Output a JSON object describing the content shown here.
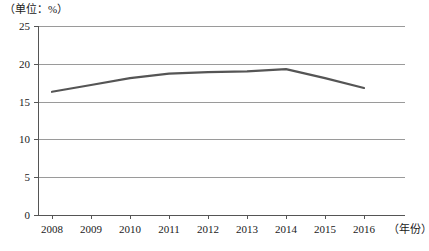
{
  "chart_data": {
    "type": "line",
    "title": "",
    "subtitle": "",
    "unit_label": "（单位：%）",
    "xlabel": "（年份）",
    "ylabel": "",
    "categories": [
      "2008",
      "2009",
      "2010",
      "2011",
      "2012",
      "2013",
      "2014",
      "2015",
      "2016"
    ],
    "x": [
      2008,
      2009,
      2010,
      2011,
      2012,
      2013,
      2014,
      2015,
      2016
    ],
    "values": [
      16.3,
      17.2,
      18.1,
      18.7,
      18.9,
      19.0,
      19.3,
      18.1,
      16.8
    ],
    "series": [
      {
        "name": "",
        "values": [
          16.3,
          17.2,
          18.1,
          18.7,
          18.9,
          19.0,
          19.3,
          18.1,
          16.8
        ]
      }
    ],
    "ylim": [
      0,
      25
    ],
    "yticks": [
      0,
      5,
      10,
      15,
      20,
      25
    ],
    "ytick_labels": [
      "0",
      "5",
      "10",
      "15",
      "20",
      "25"
    ],
    "xtick_labels": [
      "2008",
      "2009",
      "2010",
      "2011",
      "2012",
      "2013",
      "2014",
      "2015",
      "2016"
    ],
    "grid": true,
    "grid_axis": "y",
    "legend": false,
    "legend_position": "none",
    "markers": false,
    "line_color": "#555555",
    "line_width": 2.2,
    "grid_color": "#9a9a9a",
    "axis_color": "#555555",
    "background_color": "#ffffff"
  },
  "axes": {
    "y_ticks": [
      {
        "label": "25",
        "value": 25
      },
      {
        "label": "20",
        "value": 20
      },
      {
        "label": "15",
        "value": 15
      },
      {
        "label": "10",
        "value": 10
      },
      {
        "label": "5",
        "value": 5
      },
      {
        "label": "0",
        "value": 0
      }
    ],
    "x_ticks": [
      {
        "label": "2008",
        "value": 2008
      },
      {
        "label": "2009",
        "value": 2009
      },
      {
        "label": "2010",
        "value": 2010
      },
      {
        "label": "2011",
        "value": 2011
      },
      {
        "label": "2012",
        "value": 2012
      },
      {
        "label": "2013",
        "value": 2013
      },
      {
        "label": "2014",
        "value": 2014
      },
      {
        "label": "2015",
        "value": 2015
      },
      {
        "label": "2016",
        "value": 2016
      }
    ],
    "x_axis_title": "（年份）",
    "unit_caption": "（单位：%）"
  }
}
